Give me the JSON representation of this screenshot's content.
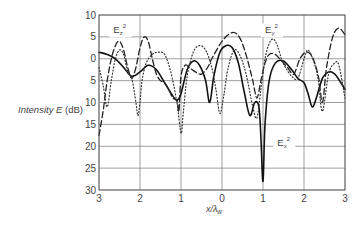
{
  "chart_data": {
    "type": "line",
    "title": "",
    "xlabel": "x/λw",
    "ylabel": "Intensity E (dB)",
    "xlim": [
      -3,
      3
    ],
    "ylim": [
      -30,
      10
    ],
    "grid": true,
    "x_ticks": [
      -3,
      -2,
      -1,
      0,
      1,
      2,
      3
    ],
    "x_tick_labels": [
      "3",
      "2",
      "1",
      "0",
      "1",
      "2",
      "3"
    ],
    "y_ticks": [
      10,
      5,
      0,
      -5,
      -10,
      -15,
      -20,
      -25,
      -30
    ],
    "y_tick_labels": [
      "10",
      "5",
      "0",
      "5",
      "10",
      "15",
      "20",
      "25",
      "30"
    ],
    "annotations": [
      {
        "text": "Ez²",
        "base": "E",
        "sub": "z",
        "sup": "2",
        "x": -2.65,
        "y": 5.8
      },
      {
        "text": "Ey²",
        "base": "E",
        "sub": "y",
        "sup": "2",
        "x": 1.05,
        "y": 5.8
      },
      {
        "text": "Ex²",
        "base": "E",
        "sub": "x",
        "sup": "2",
        "x": 1.35,
        "y": -20
      }
    ],
    "series": [
      {
        "name": "Ex²",
        "style": "solid",
        "x": [
          -3.0,
          -2.8,
          -2.6,
          -2.4,
          -2.2,
          -2.0,
          -1.8,
          -1.6,
          -1.4,
          -1.2,
          -1.1,
          -1.0,
          -0.85,
          -0.7,
          -0.55,
          -0.4,
          -0.3,
          -0.2,
          -0.05,
          0.1,
          0.25,
          0.4,
          0.55,
          0.68,
          0.8,
          0.9,
          0.95,
          1.0,
          1.05,
          1.15,
          1.3,
          1.5,
          1.7,
          1.85,
          2.0,
          2.1,
          2.2,
          2.3,
          2.45,
          2.6,
          2.75,
          2.9,
          3.0
        ],
        "values": [
          1.5,
          1.0,
          0.0,
          -2.0,
          -4.0,
          -3.0,
          -1.5,
          -2.5,
          -5.5,
          -8.5,
          -9.5,
          -8.0,
          -2.5,
          -0.5,
          -1.5,
          -5.0,
          -10.0,
          -4.0,
          1.5,
          3.0,
          2.5,
          -1.0,
          -8.0,
          -13.0,
          -10.0,
          -11.0,
          -18.0,
          -28.0,
          -15.0,
          -5.0,
          -1.0,
          -0.5,
          -2.5,
          -4.5,
          -5.5,
          -8.0,
          -11.0,
          -9.0,
          -4.5,
          -3.0,
          -3.5,
          -5.5,
          -7.0
        ]
      },
      {
        "name": "Ez²",
        "style": "dashed",
        "x": [
          -3.0,
          -2.9,
          -2.8,
          -2.7,
          -2.6,
          -2.5,
          -2.4,
          -2.3,
          -2.2,
          -2.1,
          -2.0,
          -1.9,
          -1.8,
          -1.7,
          -1.6,
          -1.5,
          -1.4,
          -1.3,
          -1.2,
          -1.1,
          -1.05,
          -1.0,
          -0.9,
          -0.8,
          -0.65,
          -0.5,
          -0.35,
          -0.25,
          -0.1,
          0.0,
          0.15,
          0.3,
          0.45,
          0.6,
          0.75,
          0.85,
          0.95,
          1.05,
          1.15,
          1.3,
          1.45,
          1.6,
          1.75,
          1.9,
          2.05,
          2.2,
          2.35,
          2.45,
          2.55,
          2.7,
          2.85,
          3.0
        ],
        "values": [
          -17.5,
          -12.0,
          -5.0,
          0.0,
          3.0,
          4.0,
          2.0,
          -2.0,
          -4.5,
          -2.0,
          2.5,
          5.0,
          4.0,
          0.0,
          -3.5,
          -5.0,
          -5.5,
          -7.0,
          -9.0,
          -9.5,
          -12.0,
          -4.0,
          -1.5,
          -2.0,
          -3.0,
          -3.5,
          -2.0,
          0.0,
          2.5,
          4.0,
          5.5,
          6.0,
          4.5,
          0.5,
          -5.0,
          -9.0,
          -5.0,
          -1.0,
          1.0,
          1.0,
          -0.5,
          -2.0,
          -3.5,
          0.0,
          1.5,
          0.5,
          -4.0,
          -10.0,
          -2.0,
          5.0,
          7.0,
          5.5
        ]
      },
      {
        "name": "Ey²",
        "style": "dotted",
        "x": [
          -3.0,
          -2.9,
          -2.8,
          -2.7,
          -2.6,
          -2.5,
          -2.4,
          -2.3,
          -2.2,
          -2.1,
          -2.05,
          -2.0,
          -1.95,
          -1.85,
          -1.7,
          -1.55,
          -1.4,
          -1.25,
          -1.1,
          -1.0,
          -0.95,
          -0.85,
          -0.7,
          -0.55,
          -0.4,
          -0.25,
          -0.15,
          -0.05,
          0.05,
          0.15,
          0.3,
          0.45,
          0.6,
          0.75,
          0.85,
          0.95,
          1.05,
          1.15,
          1.25,
          1.35,
          1.45,
          1.55,
          1.7,
          1.85,
          2.0,
          2.1,
          2.25,
          2.35,
          2.45,
          2.6,
          2.75,
          2.85,
          3.0
        ],
        "values": [
          -2.0,
          -6.0,
          -11.0,
          -5.0,
          0.0,
          2.0,
          1.0,
          -3.0,
          -4.5,
          -10.0,
          -13.0,
          -10.0,
          -5.0,
          -1.0,
          1.0,
          1.5,
          1.0,
          -3.0,
          -10.0,
          -17.0,
          -13.0,
          -4.0,
          1.5,
          3.0,
          2.0,
          -2.0,
          -7.0,
          -12.5,
          -8.0,
          -2.0,
          2.0,
          0.5,
          -4.0,
          -11.0,
          -13.5,
          -7.0,
          0.0,
          3.5,
          4.5,
          3.0,
          0.0,
          -2.0,
          -4.0,
          -4.5,
          0.0,
          2.0,
          -1.0,
          -5.0,
          -12.0,
          -3.5,
          -1.0,
          -1.5,
          -9.0
        ]
      }
    ]
  },
  "layout": {
    "plot_left": 99,
    "plot_right": 345,
    "plot_top": 15,
    "plot_bottom": 190
  },
  "labels": {
    "ylabel_main": "Intensity E",
    "ylabel_unit": " (dB)",
    "xlabel_base": "x/λ",
    "xlabel_sub": "w"
  }
}
